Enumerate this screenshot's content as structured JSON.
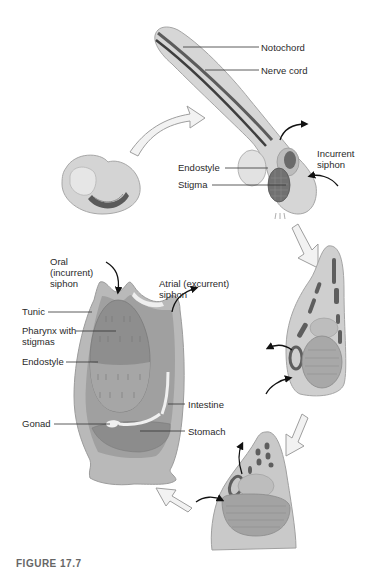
{
  "figure": {
    "caption": "FIGURE 17.7",
    "colors": {
      "body_light": "#d9d9d9",
      "body_mid": "#bdbdbd",
      "body_dark": "#9a9a9a",
      "organ_dark": "#6e6e6e",
      "cord_dark": "#4a4a4a",
      "arrow_fill": "#f2f2f2",
      "arrow_stroke": "#9e9e9e",
      "label_text": "#2a2a2a",
      "leader_line": "#333333"
    },
    "stages": [
      {
        "id": "embryo",
        "name": "Embryo (curled larva)"
      },
      {
        "id": "larva",
        "name": "Free-swimming tadpole larva"
      },
      {
        "id": "settling",
        "name": "Settling larva"
      },
      {
        "id": "metamorphosis",
        "name": "Metamorphosing juvenile"
      },
      {
        "id": "adult",
        "name": "Adult tunicate"
      }
    ],
    "larva_labels": {
      "notochord": "Notochord",
      "nerve_cord": "Nerve cord",
      "incurrent_siphon": "Incurrent\nsiphon",
      "endostyle": "Endostyle",
      "stigma": "Stigma"
    },
    "adult_labels": {
      "oral_siphon": "Oral\n(incurrent)\nsiphon",
      "atrial_siphon": "Atrial (excurrent)\nsiphon",
      "tunic": "Tunic",
      "pharynx": "Pharynx with\nstigmas",
      "endostyle": "Endostyle",
      "intestine": "Intestine",
      "gonad": "Gonad",
      "stomach": "Stomach"
    }
  }
}
